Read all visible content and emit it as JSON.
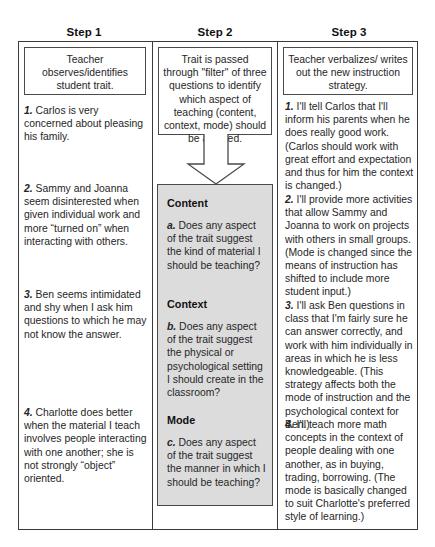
{
  "diagram": {
    "columns": [
      {
        "step_label": "Step 1",
        "summary": "Teacher observes/identifies student trait."
      },
      {
        "step_label": "Step 2",
        "summary": "Trait is passed through \"filter\" of three questions to identify which aspect of teaching (content, context, mode) should be affected."
      },
      {
        "step_label": "Step 3",
        "summary": "Teacher verbalizes/ writes out the new instruction strategy."
      }
    ]
  },
  "step1_items": [
    {
      "num": "1.",
      "text": " Carlos is very concerned about pleasing his family."
    },
    {
      "num": "2.",
      "text": " Sammy and Joanna seem disinterested when given individual work and more “turned on” when interacting with others."
    },
    {
      "num": "3.",
      "text": " Ben seems intimidated and shy when I ask him questions to which he may not know the answer."
    },
    {
      "num": "4.",
      "text": " Charlotte does better when the material I teach involves people interacting with one another; she is not strongly “object” oriented."
    }
  ],
  "filter": {
    "sections": [
      {
        "heading": "Content",
        "num": "a.",
        "question": " Does any aspect of the trait suggest the kind of material I should be teaching?"
      },
      {
        "heading": "Context",
        "num": "b.",
        "question": " Does any aspect of the trait suggest the physical or psychological setting I should create in the classroom?"
      },
      {
        "heading": "Mode",
        "num": "c.",
        "question": " Does any aspect of the trait suggest the manner in which I should be teaching?"
      }
    ]
  },
  "step3_items": [
    {
      "num": "1.",
      "text": " I'll tell Carlos that I'll inform his parents when he does really good work. (Carlos should work with great effort and expectation and thus for him the context is changed.)"
    },
    {
      "num": "2.",
      "text": " I'll provide more activities that allow Sammy and Joanna to work on projects with others in small groups. (Mode is changed since the means of instruction has shifted to include more student input.)"
    },
    {
      "num": "3.",
      "text": " I'll ask Ben questions in class that I'm fairly sure he can answer correctly, and work with him individually in areas in which he is less knowledgeable. (This strategy affects both the mode of instruction and the psychological context for Ben.)"
    },
    {
      "num": "4.",
      "text": " I'll teach more math concepts in the context of people dealing with one another, as in buying, trading, borrowing. (The mode is basically changed to suit Charlotte's preferred style of learning.)"
    }
  ],
  "colors": {
    "border": "#3a3a3a",
    "filter_fill": "#dcdcdc",
    "text": "#262626",
    "background": "#ffffff"
  }
}
